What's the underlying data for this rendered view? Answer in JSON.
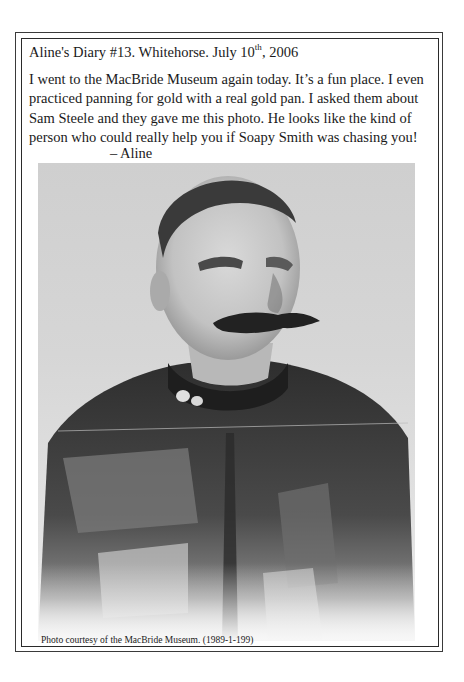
{
  "page": {
    "title": {
      "prefix": "Aline's Diary #13. Whitehorse. July 10",
      "superscript": "th",
      "suffix": ", 2006"
    },
    "body_lines": [
      "I went to the MacBride Museum again today. It’s a fun place. I even",
      "practiced panning for gold with a real gold pan. I asked them about",
      "Sam Steele and they gave me this photo. He looks like the kind of",
      "person who could really help you if Soapy Smith was chasing you!"
    ],
    "signature": "– Aline",
    "photo": {
      "subject": "Portrait of Sam Steele in uniform (black and white)",
      "tone": "grayscale"
    },
    "caption": "Photo courtesy of the MacBride Museum. (1989-1-199)"
  },
  "colors": {
    "background": "#ffffff",
    "text": "#1a1a1a",
    "frame": "#2a2a2a"
  }
}
